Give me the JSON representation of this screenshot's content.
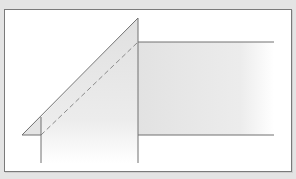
{
  "diagram": {
    "colors": {
      "background": "#e4e4e4",
      "panel": "#ffffff",
      "stroke": "#707070",
      "fill": "#e6e6e6"
    },
    "shapes": {
      "diagonal": {
        "x1": 22,
        "y1": 135,
        "x2": 138,
        "y2": 18
      },
      "dashed": {
        "x1": 41,
        "y1": 135,
        "x2": 138,
        "y2": 42
      },
      "left_vertical": {
        "x": 41,
        "y1": 117,
        "y2": 163
      },
      "right_vertical": {
        "x": 138,
        "y1": 18,
        "y2": 163
      },
      "top_horizontal": {
        "y": 42,
        "x1": 138,
        "x2": 274
      },
      "bottom_horizontal": {
        "y": 135,
        "x1": 138,
        "x2": 274
      },
      "base_line": {
        "y": 135,
        "x1": 22,
        "x2": 41
      }
    }
  }
}
